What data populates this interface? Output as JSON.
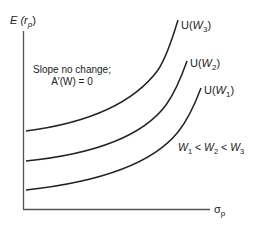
{
  "diagram": {
    "type": "indifference-curves",
    "y_axis_label": {
      "main": "E (r",
      "sub": "p",
      "close": ")"
    },
    "x_axis_label": {
      "main": "σ",
      "sub": "p"
    },
    "annotation": {
      "line1": "Slope no change;",
      "line2": "A′(W) = 0"
    },
    "ordering": {
      "w1": "W",
      "w1_sub": "1",
      "lt1": " < ",
      "w2": "W",
      "w2_sub": "2",
      "lt2": " < ",
      "w3": "W",
      "w3_sub": "3"
    },
    "curves": [
      {
        "id": "w3",
        "label_prefix": "U(",
        "label_var": "W",
        "label_sub": "3",
        "label_suffix": ")"
      },
      {
        "id": "w2",
        "label_prefix": "U(",
        "label_var": "W",
        "label_sub": "2",
        "label_suffix": ")"
      },
      {
        "id": "w1",
        "label_prefix": "U(",
        "label_var": "W",
        "label_sub": "1",
        "label_suffix": ")"
      }
    ],
    "colors": {
      "line": "#222222",
      "axis": "#555555"
    }
  }
}
